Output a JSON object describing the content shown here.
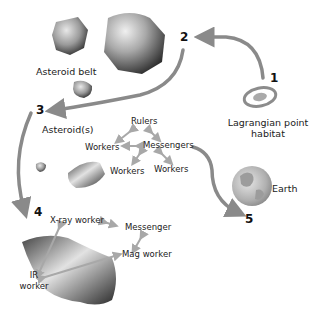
{
  "diagram": {
    "steps": [
      {
        "id": "1",
        "label": "Lagrangian point habitat"
      },
      {
        "id": "2",
        "label": "Asteroid belt"
      },
      {
        "id": "3",
        "label": "Asteroid(s)"
      },
      {
        "id": "4",
        "label": ""
      },
      {
        "id": "5",
        "label": "Earth"
      }
    ],
    "labels": {
      "asteroid_belt": "Asteroid belt",
      "lagrangian_line1": "Lagrangian point",
      "lagrangian_line2": "habitat",
      "asteroids": "Asteroid(s)",
      "earth": "Earth"
    },
    "hierarchy": {
      "rulers": "Rulers",
      "messengers": "Messengers",
      "workers_left": "Workers",
      "workers_mid": "Workers",
      "workers_right": "Workers"
    },
    "stage4": {
      "xray_worker": "X-ray worker",
      "messenger": "Messenger",
      "mag_worker": "Mag worker",
      "ir_line1": "IR",
      "ir_line2": "worker"
    },
    "colors": {
      "arrow": "#8a8a8a",
      "rock_dark": "#3a3a3a",
      "rock_light": "#cfcfcf",
      "earth": "#b8b8b8"
    }
  }
}
